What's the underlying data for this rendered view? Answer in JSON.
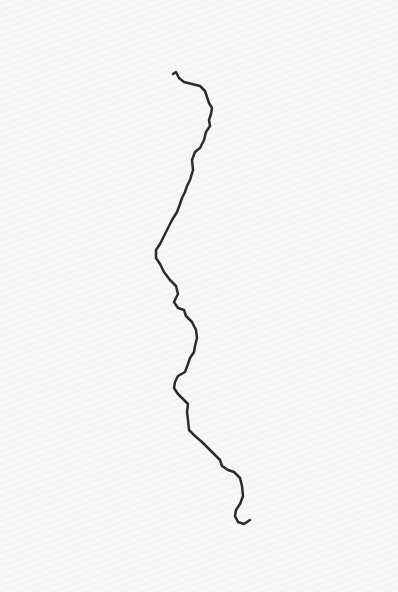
{
  "image": {
    "description": "Hand-drawn dark wavy line on textured paper",
    "stroke_color": "#2b2b2b",
    "paper_color": "#f6f6f6"
  }
}
